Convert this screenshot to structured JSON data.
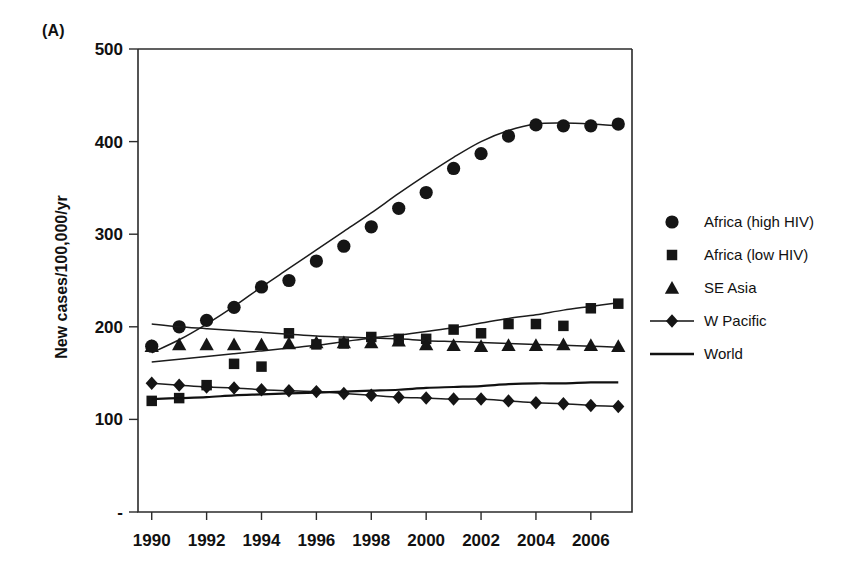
{
  "figure": {
    "panel_label": "(A)",
    "y_axis_title": "New cases/100,000/yr"
  },
  "axes": {
    "y_ticks": [
      "-",
      "100",
      "200",
      "300",
      "400",
      "500"
    ],
    "y_tick_values": [
      0,
      100,
      200,
      300,
      400,
      500
    ],
    "x_ticks": [
      "1990",
      "1992",
      "1994",
      "1996",
      "1998",
      "2000",
      "2002",
      "2004",
      "2006"
    ],
    "x_tick_values": [
      1990,
      1992,
      1994,
      1996,
      1998,
      2000,
      2002,
      2004,
      2006
    ]
  },
  "legend": {
    "items": [
      {
        "label": "Africa (high HIV)",
        "marker": "circle",
        "has_line": false
      },
      {
        "label": "Africa (low HIV)",
        "marker": "square",
        "has_line": false
      },
      {
        "label": "SE Asia",
        "marker": "triangle",
        "has_line": false
      },
      {
        "label": "W Pacific",
        "marker": "diamond",
        "has_line": true
      },
      {
        "label": "World",
        "marker": "none",
        "has_line": true
      }
    ]
  },
  "chart_data": {
    "type": "scatter",
    "title": "",
    "subtitle": "",
    "xlabel": "",
    "ylabel": "New cases/100,000/yr",
    "xlim": [
      1989.5,
      2007.5
    ],
    "ylim": [
      0,
      500
    ],
    "grid": false,
    "legend_position": "right",
    "annotations": [
      "(A)"
    ],
    "x": [
      1990,
      1991,
      1992,
      1993,
      1994,
      1995,
      1996,
      1997,
      1998,
      1999,
      2000,
      2001,
      2002,
      2003,
      2004,
      2005,
      2006,
      2007
    ],
    "series": [
      {
        "name": "Africa (high HIV)",
        "marker": "circle",
        "style": "markers+smooth-fit",
        "values": [
          179,
          200,
          207,
          221,
          243,
          250,
          271,
          287,
          308,
          328,
          345,
          371,
          387,
          406,
          418,
          417,
          417,
          419
        ],
        "fit_values": [
          172,
          186,
          203,
          222,
          243,
          263,
          283,
          303,
          323,
          344,
          364,
          383,
          400,
          412,
          419,
          420,
          419,
          417
        ]
      },
      {
        "name": "Africa (low HIV)",
        "marker": "square",
        "style": "markers+smooth-fit",
        "values": [
          120,
          123,
          137,
          160,
          157,
          193,
          181,
          182,
          189,
          187,
          187,
          197,
          193,
          203,
          203,
          201,
          220,
          225
        ],
        "fit_values": [
          162,
          165,
          168,
          171,
          174,
          177,
          180,
          184,
          188,
          191,
          195,
          199,
          204,
          209,
          213,
          218,
          222,
          226
        ]
      },
      {
        "name": "SE Asia",
        "marker": "triangle",
        "style": "markers+smooth-fit",
        "values": [
          179,
          181,
          181,
          181,
          181,
          182,
          183,
          183,
          183,
          185,
          181,
          180,
          179,
          180,
          180,
          181,
          180,
          179
        ],
        "fit_values": [
          203,
          200,
          198,
          196,
          194,
          192,
          190,
          189,
          188,
          187,
          185,
          184,
          183,
          182,
          181,
          180,
          179,
          178
        ]
      },
      {
        "name": "W Pacific",
        "marker": "diamond",
        "style": "markers+line",
        "values": [
          139,
          137,
          135,
          134,
          132,
          131,
          130,
          128,
          126,
          124,
          123,
          122,
          122,
          120,
          118,
          117,
          115,
          114
        ]
      },
      {
        "name": "World",
        "marker": "none",
        "style": "line",
        "values": [
          122,
          123,
          124,
          126,
          127,
          128,
          129,
          130,
          131,
          132,
          134,
          135,
          136,
          138,
          139,
          139,
          140,
          140
        ]
      }
    ]
  }
}
